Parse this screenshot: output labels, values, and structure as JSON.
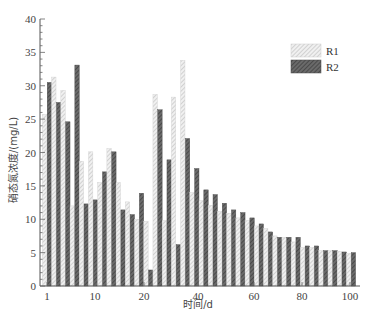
{
  "chart_data": {
    "type": "bar",
    "title": "",
    "xlabel": "时间/d",
    "ylabel": "硝态氮浓度/(mg/L)",
    "ylim": [
      0,
      40
    ],
    "yticks": [
      0,
      5,
      10,
      15,
      20,
      25,
      30,
      35,
      40
    ],
    "xtick_labels": [
      "1",
      "10",
      "20",
      "40",
      "60",
      "80",
      "100"
    ],
    "grid": false,
    "legend_position": "upper right",
    "categories": [
      1,
      4,
      7,
      10,
      13,
      16,
      19,
      22,
      25,
      28,
      31,
      34,
      37,
      40,
      43,
      46,
      49,
      52,
      55,
      58,
      61,
      64,
      67,
      70,
      73,
      76,
      79,
      82,
      85,
      88,
      91,
      94,
      97,
      100
    ],
    "series": [
      {
        "name": "R1",
        "color": "#d8d8d8",
        "pattern": "light-hatch",
        "values": [
          25.7,
          31.3,
          29.3,
          12.0,
          18.7,
          20.1,
          15.5,
          20.6,
          15.5,
          12.6,
          10.0,
          9.7,
          28.7,
          9.8,
          28.3,
          33.8,
          14.0,
          12.8,
          12.1,
          11.2,
          10.9,
          10.2,
          9.8,
          9.0,
          8.6,
          7.5,
          7.3,
          6.6,
          5.8,
          5.8,
          5.3,
          5.3,
          5.2,
          4.9
        ]
      },
      {
        "name": "R2",
        "color": "#555555",
        "pattern": "dark-hatch",
        "values": [
          30.5,
          27.5,
          24.6,
          33.1,
          12.3,
          12.9,
          17.1,
          20.1,
          11.4,
          10.7,
          13.9,
          2.4,
          26.4,
          18.9,
          6.2,
          22.1,
          17.6,
          14.4,
          13.7,
          12.4,
          11.4,
          11.0,
          10.2,
          9.3,
          8.1,
          7.3,
          7.3,
          7.3,
          6.0,
          6.0,
          5.3,
          5.3,
          5.1,
          5.0
        ]
      }
    ]
  },
  "legend": {
    "items": [
      {
        "label": "R1"
      },
      {
        "label": "R2"
      }
    ]
  },
  "axes": {
    "xlabel": "时间/d",
    "ylabel": "硝态氮浓度/(mg/L)"
  }
}
